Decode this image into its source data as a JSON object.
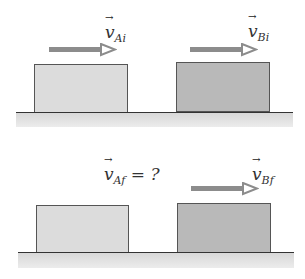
{
  "colors": {
    "block_a": "#dcdcdc",
    "block_b": "#b9b9b9",
    "arrow": "#8c8c8c",
    "ground": "#333333"
  },
  "initial": {
    "label_a": {
      "symbol": "v",
      "sub": "Ai",
      "vec": "→"
    },
    "label_b": {
      "symbol": "v",
      "sub": "Bi",
      "vec": "→"
    }
  },
  "final": {
    "label_a": {
      "symbol": "v",
      "sub": "Af",
      "vec": "→",
      "suffix": " = ?"
    },
    "label_b": {
      "symbol": "v",
      "sub": "Bf",
      "vec": "→"
    }
  }
}
